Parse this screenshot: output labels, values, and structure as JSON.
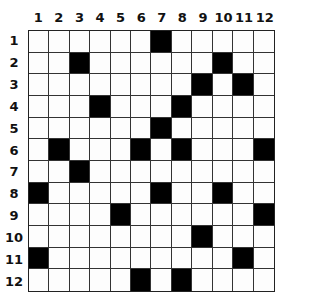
{
  "puzzle": {
    "rows": 12,
    "cols": 12,
    "col_labels": [
      "1",
      "2",
      "3",
      "4",
      "5",
      "6",
      "7",
      "8",
      "9",
      "10",
      "11",
      "12"
    ],
    "row_labels": [
      "1",
      "2",
      "3",
      "4",
      "5",
      "6",
      "7",
      "8",
      "9",
      "10",
      "11",
      "12"
    ],
    "black_cells": {
      "1": [
        7
      ],
      "2": [
        3,
        10
      ],
      "3": [
        9,
        11
      ],
      "4": [
        4,
        8
      ],
      "5": [
        7
      ],
      "6": [
        2,
        6,
        8,
        12
      ],
      "7": [
        3
      ],
      "8": [
        1,
        7,
        10
      ],
      "9": [
        5,
        12
      ],
      "10": [
        9
      ],
      "11": [
        1,
        11
      ],
      "12": [
        6,
        8
      ]
    },
    "colors": {
      "black": "#000000",
      "white": "#fdfdfd",
      "line": "#333333"
    }
  }
}
